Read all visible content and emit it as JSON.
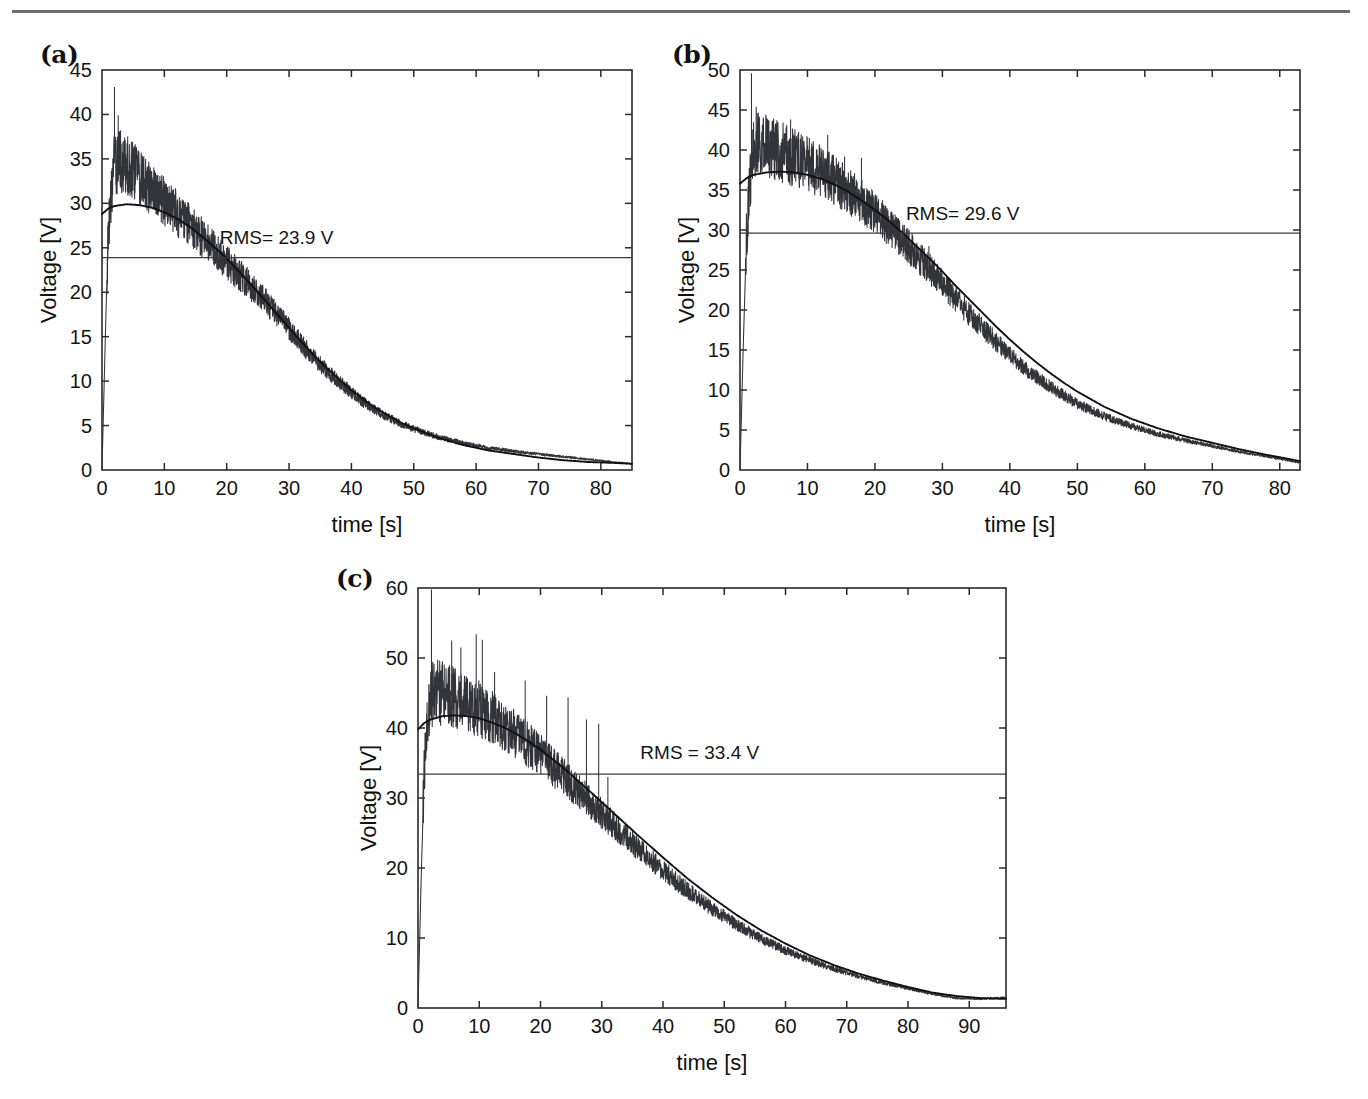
{
  "figure": {
    "separator": "top-rule",
    "axis_title_x": "time [s]",
    "axis_title_y": "Voltage [V]",
    "panel_a_tag": "(a)",
    "panel_b_tag": "(b)",
    "panel_c_tag": "(c)"
  },
  "chart_data": [
    {
      "id": "a",
      "type": "line",
      "panel_label": "(a)",
      "title": "",
      "xlabel": "time [s]",
      "ylabel": "Voltage [V]",
      "xlim": [
        0,
        85
      ],
      "ylim": [
        0,
        45
      ],
      "xticks": [
        0,
        10,
        20,
        30,
        40,
        50,
        60,
        70,
        80
      ],
      "yticks": [
        0,
        5,
        10,
        15,
        20,
        25,
        30,
        35,
        40,
        45
      ],
      "grid": false,
      "legend": "none",
      "annotations": [
        {
          "text": "RMS= 23.9 V",
          "x": 28,
          "y": 25.4
        }
      ],
      "rms_value": 23.9,
      "rms_label": "RMS= 23.9 V",
      "series": [
        {
          "name": "measured voltage",
          "style": "noisy",
          "noise_amplitude": 1.9,
          "noise_decay": 0.052,
          "spikes": [
            {
              "x": 2.0,
              "y": 43.1
            },
            {
              "x": 2.6,
              "y": 39.9
            },
            {
              "x": 3.4,
              "y": 37.0
            },
            {
              "x": 7.5,
              "y": 34.3
            },
            {
              "x": 10.5,
              "y": 31.8
            },
            {
              "x": 17.5,
              "y": 24.0
            },
            {
              "x": 23.5,
              "y": 22.5
            }
          ],
          "x": [
            0,
            0.5,
            1,
            1.5,
            2,
            3,
            4,
            5,
            6,
            7,
            8,
            10,
            12,
            14,
            16,
            18,
            20,
            22,
            24,
            26,
            28,
            30,
            32,
            34,
            36,
            38,
            40,
            42,
            44,
            46,
            48,
            50,
            54,
            58,
            62,
            66,
            70,
            74,
            78,
            82,
            85
          ],
          "y": [
            0,
            14,
            27,
            31,
            34.5,
            34.8,
            34.2,
            33.6,
            32.9,
            32.2,
            31.5,
            30.2,
            28.9,
            27.6,
            26.2,
            24.8,
            23.4,
            22.0,
            20.6,
            19.2,
            17.6,
            15.9,
            14.2,
            12.6,
            11.2,
            9.9,
            8.7,
            7.6,
            6.7,
            5.9,
            5.2,
            4.6,
            3.7,
            3.0,
            2.5,
            2.1,
            1.8,
            1.5,
            1.2,
            0.9,
            0.7
          ]
        },
        {
          "name": "fitted curve",
          "style": "smooth",
          "x": [
            0,
            1,
            2,
            4,
            6,
            8,
            10,
            12,
            14,
            16,
            18,
            20,
            22,
            24,
            26,
            28,
            30,
            32,
            34,
            36,
            38,
            40,
            42,
            44,
            46,
            48,
            50,
            54,
            58,
            62,
            66,
            70,
            74,
            78,
            82,
            85
          ],
          "y": [
            28.8,
            29.4,
            29.7,
            29.9,
            29.8,
            29.5,
            29.0,
            28.3,
            27.4,
            26.3,
            25.1,
            23.8,
            22.3,
            20.8,
            19.2,
            17.6,
            16.0,
            14.4,
            12.9,
            11.5,
            10.2,
            9.0,
            7.9,
            6.9,
            6.1,
            5.3,
            4.7,
            3.6,
            2.8,
            2.2,
            1.8,
            1.4,
            1.1,
            0.9,
            0.8,
            0.7
          ]
        }
      ]
    },
    {
      "id": "b",
      "type": "line",
      "panel_label": "(b)",
      "title": "",
      "xlabel": "time [s]",
      "ylabel": "Voltage [V]",
      "xlim": [
        0,
        83
      ],
      "ylim": [
        0,
        50
      ],
      "xticks": [
        0,
        10,
        20,
        30,
        40,
        50,
        60,
        70,
        80
      ],
      "yticks": [
        0,
        5,
        10,
        15,
        20,
        25,
        30,
        35,
        40,
        45,
        50
      ],
      "grid": false,
      "legend": "none",
      "annotations": [
        {
          "text": "RMS= 29.6 V",
          "x": 33,
          "y": 31.3
        }
      ],
      "rms_value": 29.6,
      "rms_label": "RMS= 29.6 V",
      "series": [
        {
          "name": "measured voltage",
          "style": "noisy",
          "noise_amplitude": 2.2,
          "noise_decay": 0.048,
          "spikes": [
            {
              "x": 1.7,
              "y": 49.6
            },
            {
              "x": 2.4,
              "y": 45.4
            },
            {
              "x": 4.8,
              "y": 43.5
            },
            {
              "x": 7.5,
              "y": 43.8
            },
            {
              "x": 13.0,
              "y": 41.9
            },
            {
              "x": 15.5,
              "y": 39.2
            },
            {
              "x": 18.0,
              "y": 39.0
            },
            {
              "x": 19.5,
              "y": 30.0
            },
            {
              "x": 28.0,
              "y": 28.0
            },
            {
              "x": 37.5,
              "y": 15.2
            }
          ],
          "x": [
            0,
            0.5,
            1,
            1.5,
            2,
            3,
            4,
            5,
            6,
            8,
            10,
            12,
            14,
            16,
            18,
            20,
            22,
            24,
            26,
            28,
            30,
            32,
            34,
            36,
            38,
            40,
            42,
            44,
            46,
            48,
            50,
            54,
            58,
            62,
            66,
            70,
            74,
            78,
            80,
            83
          ],
          "y": [
            0,
            16,
            30,
            36,
            40.2,
            40.7,
            40.5,
            40.2,
            39.8,
            39.0,
            38.3,
            37.3,
            36.2,
            35.0,
            33.6,
            32.1,
            30.5,
            28.8,
            27.0,
            25.2,
            23.3,
            21.4,
            19.5,
            17.7,
            16.0,
            14.4,
            12.9,
            11.6,
            10.4,
            9.3,
            8.3,
            6.7,
            5.5,
            4.5,
            3.7,
            3.0,
            2.3,
            1.7,
            1.4,
            0.9
          ]
        },
        {
          "name": "fitted curve",
          "style": "smooth",
          "x": [
            0,
            1,
            2,
            4,
            6,
            8,
            10,
            12,
            14,
            16,
            18,
            20,
            22,
            24,
            26,
            28,
            30,
            32,
            34,
            36,
            38,
            40,
            42,
            44,
            46,
            48,
            50,
            54,
            58,
            62,
            66,
            70,
            74,
            78,
            80,
            83
          ],
          "y": [
            35.8,
            36.5,
            36.9,
            37.2,
            37.3,
            37.2,
            36.9,
            36.4,
            35.7,
            34.8,
            33.7,
            32.5,
            31.2,
            29.7,
            28.1,
            26.5,
            24.8,
            23.0,
            21.3,
            19.6,
            17.9,
            16.3,
            14.8,
            13.4,
            12.1,
            10.9,
            9.8,
            7.9,
            6.4,
            5.2,
            4.2,
            3.4,
            2.6,
            1.9,
            1.6,
            1.1
          ]
        }
      ]
    },
    {
      "id": "c",
      "type": "line",
      "panel_label": "(c)",
      "title": "",
      "xlabel": "time [s]",
      "ylabel": "Voltage [V]",
      "xlim": [
        0,
        96
      ],
      "ylim": [
        0,
        60
      ],
      "xticks": [
        0,
        10,
        20,
        30,
        40,
        50,
        60,
        70,
        80,
        90
      ],
      "yticks": [
        0,
        10,
        20,
        30,
        40,
        50,
        60
      ],
      "grid": false,
      "legend": "none",
      "annotations": [
        {
          "text": "RMS = 33.4 V",
          "x": 46,
          "y": 35.6
        }
      ],
      "rms_value": 33.4,
      "rms_label": "RMS = 33.4 V",
      "series": [
        {
          "name": "measured voltage",
          "style": "noisy",
          "noise_amplitude": 2.6,
          "noise_decay": 0.045,
          "spikes": [
            {
              "x": 2.2,
              "y": 59.8
            },
            {
              "x": 5.5,
              "y": 52.5
            },
            {
              "x": 7.0,
              "y": 51.5
            },
            {
              "x": 9.5,
              "y": 53.4
            },
            {
              "x": 10.5,
              "y": 52.6
            },
            {
              "x": 12.5,
              "y": 48.0
            },
            {
              "x": 17.5,
              "y": 46.8
            },
            {
              "x": 21.0,
              "y": 44.6
            },
            {
              "x": 24.5,
              "y": 44.4
            },
            {
              "x": 27.5,
              "y": 41.2
            },
            {
              "x": 29.5,
              "y": 40.6
            },
            {
              "x": 31.0,
              "y": 33.0
            }
          ],
          "x": [
            0,
            0.5,
            1,
            1.5,
            2,
            3,
            4,
            6,
            8,
            10,
            12,
            14,
            16,
            18,
            20,
            24,
            28,
            32,
            36,
            40,
            44,
            48,
            52,
            56,
            60,
            64,
            68,
            72,
            76,
            80,
            84,
            88,
            92,
            96
          ],
          "y": [
            0,
            18,
            33,
            40,
            44.5,
            45.2,
            45.0,
            44.4,
            43.6,
            42.7,
            41.6,
            40.4,
            39.0,
            37.6,
            36.1,
            32.9,
            29.5,
            26.1,
            22.8,
            19.7,
            16.8,
            14.2,
            11.9,
            9.9,
            8.2,
            6.8,
            5.6,
            4.5,
            3.6,
            2.8,
            2.0,
            1.4,
            1.3,
            1.5
          ]
        },
        {
          "name": "fitted curve",
          "style": "smooth",
          "x": [
            0,
            1,
            2,
            4,
            6,
            8,
            10,
            12,
            14,
            16,
            18,
            20,
            24,
            28,
            32,
            36,
            40,
            44,
            48,
            52,
            56,
            60,
            64,
            68,
            72,
            76,
            80,
            84,
            88,
            92,
            96
          ],
          "y": [
            39.8,
            40.7,
            41.2,
            41.7,
            41.8,
            41.7,
            41.4,
            40.8,
            40.1,
            39.2,
            38.1,
            36.9,
            34.1,
            31.0,
            27.8,
            24.6,
            21.5,
            18.5,
            15.8,
            13.3,
            11.1,
            9.2,
            7.5,
            6.1,
            4.9,
            3.9,
            3.0,
            2.2,
            1.7,
            1.4,
            1.3
          ]
        }
      ]
    }
  ]
}
